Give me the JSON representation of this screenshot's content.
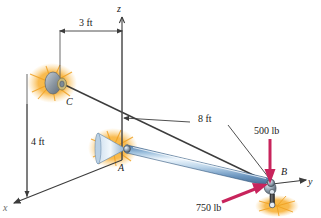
{
  "figure": {
    "background_color": "#ffffff"
  },
  "axes": {
    "z": {
      "label": "z"
    },
    "y": {
      "label": "y"
    },
    "x": {
      "label": "x"
    },
    "color": "#4a4a4a"
  },
  "points": {
    "a": {
      "label": "A"
    },
    "b": {
      "label": "B"
    },
    "c": {
      "label": "C"
    }
  },
  "dimensions": [
    {
      "id": "dim-3ft",
      "label": "3 ft"
    },
    {
      "id": "dim-4ft",
      "label": "4 ft"
    },
    {
      "id": "dim-8ft",
      "label": "8 ft"
    }
  ],
  "forces": [
    {
      "id": "force-500",
      "label": "500 lb",
      "color": "#c8245c",
      "direction": "down"
    },
    {
      "id": "force-750",
      "label": "750 lb",
      "color": "#c8245c",
      "direction": "up-right"
    }
  ],
  "colors": {
    "boom_light": "#dce9f5",
    "boom_mid": "#7fa6cc",
    "boom_dark": "#3f6b99",
    "support_orange": "#f5a623",
    "support_orange_light": "#fbd07a",
    "joint_gray": "#8f9aa6",
    "line": "#3c3c3c",
    "force": "#c8245c"
  }
}
